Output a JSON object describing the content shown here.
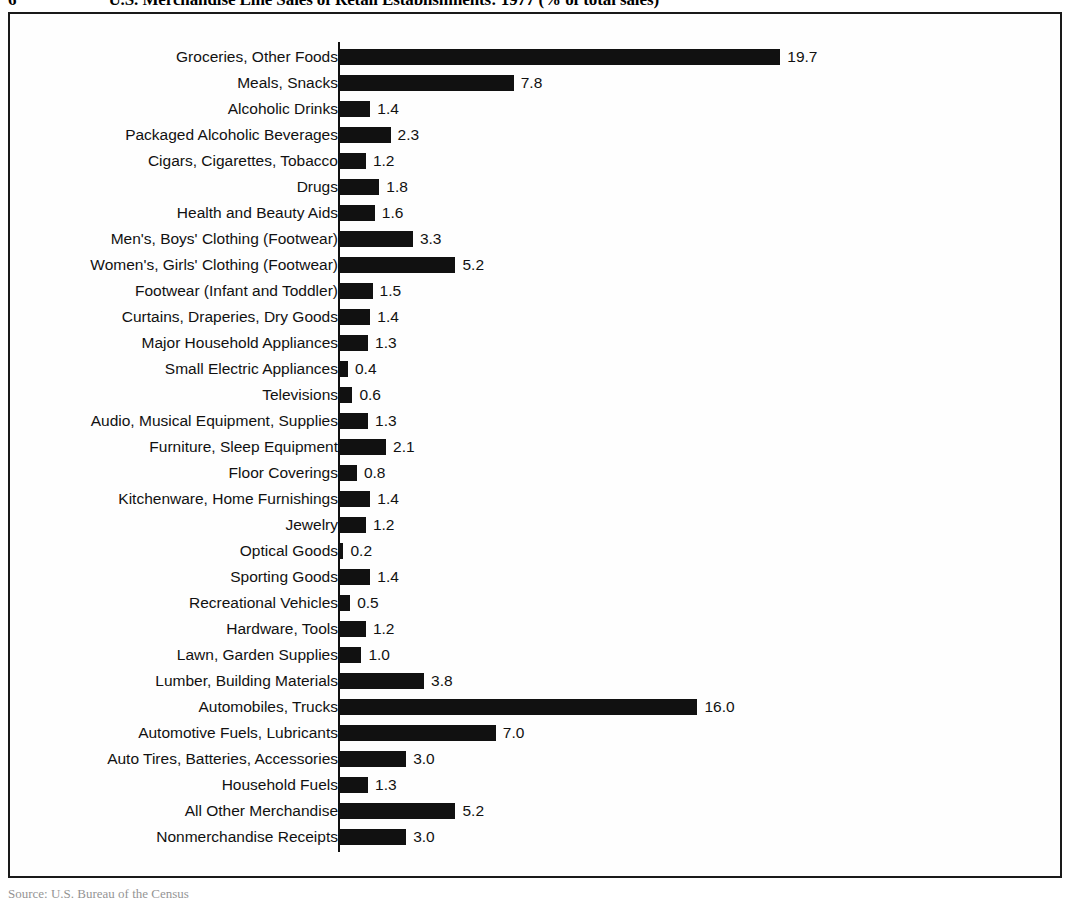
{
  "figure": {
    "number": "6",
    "caption": "U.S. Merchandise Line Sales of Retail Establishments: 1977 (% of total sales)",
    "source_note": "Source: U.S. Bureau of the Census"
  },
  "colors": {
    "bar": "#111111",
    "frame": "#1a1a1a",
    "background": "#ffffff",
    "text": "#111111"
  },
  "chart_data": {
    "type": "bar",
    "orientation": "horizontal",
    "title": "U.S. Merchandise Line Sales of Retail Establishments: 1977 (% of total sales)",
    "xlabel": "",
    "ylabel": "",
    "xlim": [
      0,
      20.5
    ],
    "grid": false,
    "legend": null,
    "value_labels": true,
    "units": "% of total sales",
    "categories": [
      "Groceries, Other Foods",
      "Meals, Snacks",
      "Alcoholic Drinks",
      "Packaged Alcoholic Beverages",
      "Cigars, Cigarettes, Tobacco",
      "Drugs",
      "Health and Beauty Aids",
      "Men's, Boys' Clothing (Footwear)",
      "Women's, Girls' Clothing (Footwear)",
      "Footwear (Infant and Toddler)",
      "Curtains, Draperies, Dry Goods",
      "Major Household Appliances",
      "Small Electric Appliances",
      "Televisions",
      "Audio, Musical Equipment, Supplies",
      "Furniture, Sleep Equipment",
      "Floor Coverings",
      "Kitchenware, Home Furnishings",
      "Jewelry",
      "Optical Goods",
      "Sporting Goods",
      "Recreational Vehicles",
      "Hardware, Tools",
      "Lawn, Garden Supplies",
      "Lumber, Building Materials",
      "Automobiles, Trucks",
      "Automotive Fuels, Lubricants",
      "Auto Tires, Batteries, Accessories",
      "Household Fuels",
      "All Other Merchandise",
      "Nonmerchandise Receipts"
    ],
    "values": [
      19.7,
      7.8,
      1.4,
      2.3,
      1.2,
      1.8,
      1.6,
      3.3,
      5.2,
      1.5,
      1.4,
      1.3,
      0.4,
      0.6,
      1.3,
      2.1,
      0.8,
      1.4,
      1.2,
      0.2,
      1.4,
      0.5,
      1.2,
      1.0,
      3.8,
      16.0,
      7.0,
      3.0,
      1.3,
      5.2,
      3.0
    ],
    "value_label_text": [
      "19.7",
      "7.8",
      "1.4",
      "2.3",
      "1.2",
      "1.8",
      "1.6",
      "3.3",
      "5.2",
      "1.5",
      "1.4",
      "1.3",
      "0.4",
      "0.6",
      "1.3",
      "2.1",
      "0.8",
      "1.4",
      "1.2",
      "0.2",
      "1.4",
      "0.5",
      "1.2",
      "1.0",
      "3.8",
      "16.0",
      "7.0",
      "3.0",
      "1.3",
      "5.2",
      "3.0"
    ]
  }
}
